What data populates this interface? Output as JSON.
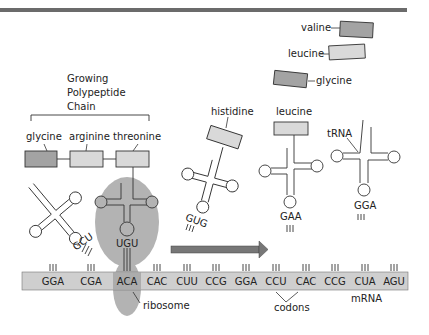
{
  "diagram": {
    "title_bar_color": "#6b6b6b",
    "colors": {
      "dark_box": "#a3a3a3",
      "light_box": "#d9d9d9",
      "ribosome": "#b3b3b3",
      "mrna": "#cfcfcf",
      "arrow": "#777777",
      "stroke": "#333333"
    },
    "chain": {
      "label_lines": [
        "Growing",
        "Polypeptide",
        "Chain"
      ],
      "amino_acids": [
        {
          "name": "glycine",
          "shade": "dark"
        },
        {
          "name": "arginine",
          "shade": "light"
        },
        {
          "name": "threonine",
          "shade": "light"
        }
      ]
    },
    "free_amino_acids": [
      {
        "name": "valine",
        "shade": "dark"
      },
      {
        "name": "leucine",
        "shade": "light"
      },
      {
        "name": "glycine",
        "shade": "dark"
      }
    ],
    "trnas": [
      {
        "anticodon": "GCU",
        "amino_acid": ""
      },
      {
        "anticodon": "UGU",
        "amino_acid": ""
      },
      {
        "anticodon": "GUG",
        "amino_acid": "histidine"
      },
      {
        "anticodon": "GAA",
        "amino_acid": "leucine"
      },
      {
        "anticodon": "GGA",
        "amino_acid": "",
        "label": "tRNA"
      }
    ],
    "mrna": {
      "label": "mRNA",
      "codons": [
        "GGA",
        "CGA",
        "ACA",
        "CAC",
        "CUU",
        "CCG",
        "GGA",
        "CCU",
        "CAC",
        "CCG",
        "CUA",
        "AGU"
      ]
    },
    "labels": {
      "ribosome": "ribosome",
      "codons": "codons",
      "trna": "tRNA"
    }
  }
}
